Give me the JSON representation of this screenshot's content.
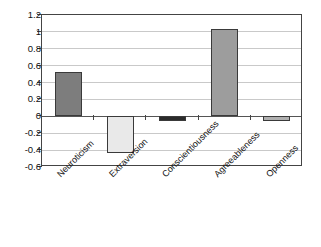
{
  "chart_data": {
    "type": "bar",
    "title": "",
    "subtitle": "",
    "xlabel": "",
    "ylabel": "",
    "categories": [
      "Neuroticism",
      "Extraversion",
      "Conscientiousness",
      "Agreeableness",
      "Openness"
    ],
    "values": [
      0.53,
      -0.43,
      -0.06,
      1.03,
      -0.05
    ],
    "bar_colors": [
      "#7d7d7d",
      "#e9e9e9",
      "#2b2b2b",
      "#9d9d9d",
      "#b0b0b0"
    ],
    "bar_border_color": "#3a3a3a",
    "ylim": [
      -0.6,
      1.2
    ],
    "ytick_values": [
      1.2,
      1,
      0.8,
      0.6,
      0.4,
      0.2,
      0,
      -0.2,
      -0.4,
      -0.6
    ],
    "ytick_labels": [
      "1.2",
      "1",
      "0.8",
      "0.6",
      "0.4",
      "0.2",
      "0",
      "-0.2",
      "-0.4",
      "-0.6"
    ],
    "grid": true,
    "grid_color": "#c9c9c9",
    "legend": null,
    "legend_position": "none",
    "annotations": [],
    "axis_color": "#444444",
    "plot_background": "#ffffff",
    "label_rotation_degrees": -45
  }
}
